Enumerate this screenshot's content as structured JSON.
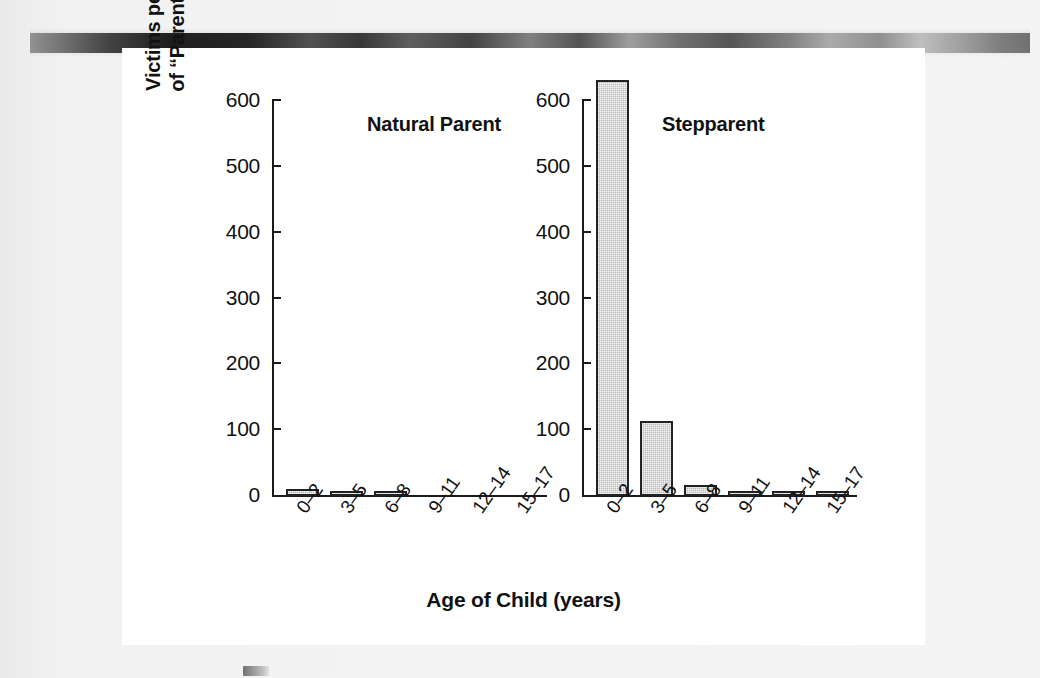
{
  "figure": {
    "y_axis_title_line1": "Victims per Million Child-Years",
    "y_axis_title_line2": "of “Parent”–Child Coresidence",
    "x_axis_title": "Age of Child (years)"
  },
  "chart_data": {
    "type": "bar",
    "title": "",
    "xlabel": "Age of Child (years)",
    "ylabel": "Victims per Million Child-Years of “Parent”–Child Coresidence",
    "categories": [
      "0–2",
      "3–5",
      "6–8",
      "9–11",
      "12–14",
      "15–17"
    ],
    "yticks": [
      0,
      100,
      200,
      300,
      400,
      500,
      600
    ],
    "ytick_labels": [
      "0",
      "100",
      "200",
      "300",
      "400",
      "500",
      "600"
    ],
    "ylim": [
      0,
      640
    ],
    "grid": false,
    "legend": "none",
    "panels": [
      {
        "name": "Natural Parent",
        "label": "Natural Parent",
        "values": [
          10,
          4,
          4,
          0,
          0,
          0
        ]
      },
      {
        "name": "Stepparent",
        "label": "Stepparent",
        "values": [
          632,
          114,
          16,
          8,
          8,
          8
        ]
      }
    ],
    "bar_fill_color": "#b9b9b9",
    "bar_edge_color": "#222222",
    "axis_color": "#1a1a1a"
  }
}
